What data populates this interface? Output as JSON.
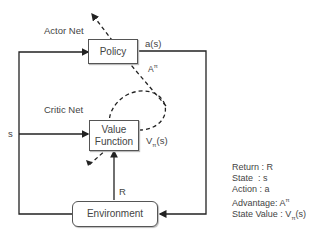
{
  "diagram": {
    "labels": {
      "actor_net": "Actor Net",
      "critic_net": "Critic Net",
      "action_output": "a(s)",
      "advantage": "A",
      "advantage_sup": "π",
      "state_input": "s",
      "value_output_base": "V",
      "value_output_sub": "π",
      "value_output_arg": "(s)",
      "return_label": "R"
    },
    "nodes": {
      "policy": "Policy",
      "value_function_line1": "Value",
      "value_function_line2": "Function",
      "environment": "Environment"
    },
    "legend": [
      {
        "text": "Return : R"
      },
      {
        "text": "State  : s"
      },
      {
        "text": "Action : a"
      },
      {
        "text": "Advantage: A",
        "sup": "π"
      },
      {
        "text": "State Value : V",
        "sub": "π",
        "suffix": "(s)"
      }
    ],
    "colors": {
      "line": "#222222",
      "box_border": "#555555",
      "text": "#444444"
    }
  }
}
